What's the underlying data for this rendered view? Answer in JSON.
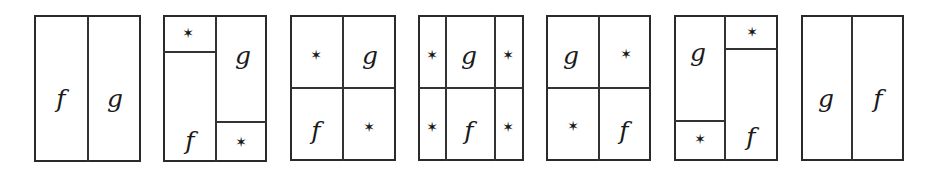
{
  "diagram": {
    "symbols": {
      "f": "f",
      "g": "g",
      "star": "✶"
    },
    "panels": [
      {
        "id": 1,
        "frame": [
          34,
          15,
          141,
          162
        ],
        "vlines": [
          [
            88,
            15,
            162
          ]
        ],
        "hlines": [],
        "labels": [
          {
            "t": "f",
            "x": 61,
            "y": 98
          },
          {
            "t": "g",
            "x": 115,
            "y": 98
          }
        ]
      },
      {
        "id": 2,
        "frame": [
          163,
          15,
          267,
          162
        ],
        "vlines": [
          [
            216,
            15,
            162
          ]
        ],
        "hlines": [
          [
            163,
            216,
            52
          ],
          [
            216,
            267,
            122
          ]
        ],
        "labels": [
          {
            "t": "*",
            "x": 188,
            "y": 33
          },
          {
            "t": "g",
            "x": 243,
            "y": 55
          },
          {
            "t": "f",
            "x": 190,
            "y": 140
          },
          {
            "t": "*",
            "x": 241,
            "y": 142
          }
        ]
      },
      {
        "id": 3,
        "frame": [
          290,
          15,
          396,
          161
        ],
        "vlines": [
          [
            343,
            15,
            161
          ]
        ],
        "hlines": [
          [
            290,
            396,
            88
          ]
        ],
        "labels": [
          {
            "t": "*",
            "x": 316,
            "y": 55
          },
          {
            "t": "g",
            "x": 370,
            "y": 55
          },
          {
            "t": "f",
            "x": 316,
            "y": 130
          },
          {
            "t": "*",
            "x": 369,
            "y": 127
          }
        ]
      },
      {
        "id": 4,
        "frame": [
          418,
          15,
          524,
          161
        ],
        "vlines": [
          [
            446,
            15,
            161
          ],
          [
            495,
            15,
            161
          ]
        ],
        "hlines": [
          [
            418,
            524,
            88
          ]
        ],
        "labels": [
          {
            "t": "*",
            "x": 432,
            "y": 55
          },
          {
            "t": "g",
            "x": 469,
            "y": 55
          },
          {
            "t": "*",
            "x": 508,
            "y": 55
          },
          {
            "t": "*",
            "x": 432,
            "y": 127
          },
          {
            "t": "f",
            "x": 469,
            "y": 130
          },
          {
            "t": "*",
            "x": 508,
            "y": 127
          }
        ]
      },
      {
        "id": 5,
        "frame": [
          546,
          15,
          651,
          161
        ],
        "vlines": [
          [
            599,
            15,
            161
          ]
        ],
        "hlines": [
          [
            546,
            651,
            88
          ]
        ],
        "labels": [
          {
            "t": "g",
            "x": 571,
            "y": 55
          },
          {
            "t": "*",
            "x": 626,
            "y": 54
          },
          {
            "t": "*",
            "x": 573,
            "y": 126
          },
          {
            "t": "f",
            "x": 624,
            "y": 130
          }
        ]
      },
      {
        "id": 6,
        "frame": [
          674,
          15,
          778,
          161
        ],
        "vlines": [
          [
            725,
            15,
            161
          ]
        ],
        "hlines": [
          [
            674,
            725,
            121
          ],
          [
            725,
            778,
            49
          ]
        ],
        "labels": [
          {
            "t": "g",
            "x": 698,
            "y": 52
          },
          {
            "t": "*",
            "x": 752,
            "y": 32
          },
          {
            "t": "*",
            "x": 700,
            "y": 139
          },
          {
            "t": "f",
            "x": 751,
            "y": 136
          }
        ]
      },
      {
        "id": 7,
        "frame": [
          801,
          15,
          904,
          161
        ],
        "vlines": [
          [
            852,
            15,
            161
          ]
        ],
        "hlines": [],
        "labels": [
          {
            "t": "g",
            "x": 826,
            "y": 98
          },
          {
            "t": "f",
            "x": 878,
            "y": 98
          }
        ]
      }
    ]
  }
}
